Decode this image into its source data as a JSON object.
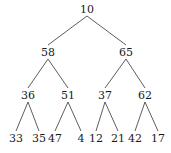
{
  "tree": {
    "nodes": [
      {
        "id": 0,
        "value": "10",
        "x": 87,
        "y": 9
      },
      {
        "id": 1,
        "value": "58",
        "x": 48,
        "y": 52
      },
      {
        "id": 2,
        "value": "65",
        "x": 126,
        "y": 52
      },
      {
        "id": 3,
        "value": "36",
        "x": 28,
        "y": 95
      },
      {
        "id": 4,
        "value": "51",
        "x": 68,
        "y": 95
      },
      {
        "id": 5,
        "value": "37",
        "x": 105,
        "y": 95
      },
      {
        "id": 6,
        "value": "62",
        "x": 145,
        "y": 95
      },
      {
        "id": 7,
        "value": "33",
        "x": 16,
        "y": 138
      },
      {
        "id": 8,
        "value": "35",
        "x": 39,
        "y": 138
      },
      {
        "id": 9,
        "value": "47",
        "x": 55,
        "y": 138
      },
      {
        "id": 10,
        "value": "4",
        "x": 81,
        "y": 138
      },
      {
        "id": 11,
        "value": "12",
        "x": 96,
        "y": 138
      },
      {
        "id": 12,
        "value": "21",
        "x": 118,
        "y": 138
      },
      {
        "id": 13,
        "value": "42",
        "x": 135,
        "y": 138
      },
      {
        "id": 14,
        "value": "17",
        "x": 158,
        "y": 138
      }
    ],
    "edges": [
      [
        0,
        1
      ],
      [
        0,
        2
      ],
      [
        1,
        3
      ],
      [
        1,
        4
      ],
      [
        2,
        5
      ],
      [
        2,
        6
      ],
      [
        3,
        7
      ],
      [
        3,
        8
      ],
      [
        4,
        9
      ],
      [
        4,
        10
      ],
      [
        5,
        11
      ],
      [
        5,
        12
      ],
      [
        6,
        13
      ],
      [
        6,
        14
      ]
    ],
    "line_color": "#333333"
  }
}
